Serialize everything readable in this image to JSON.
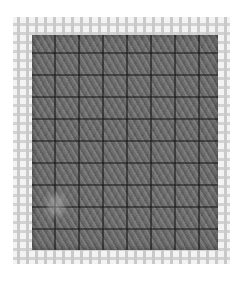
{
  "image": {
    "subject": "Needlepoint stitch sample on plastic canvas",
    "description": "Grey yarn diagonal stitches worked in a grid on a white plastic mesh canvas",
    "colors": {
      "background": "#ffffff",
      "canvas_mesh": "#d0d0d0",
      "yarn": "#6e6e6e",
      "grid_lines": "#202020"
    }
  }
}
